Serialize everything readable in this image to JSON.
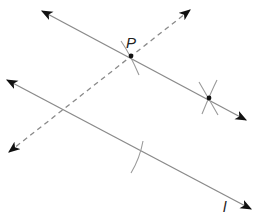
{
  "diagram": {
    "width": 257,
    "height": 216,
    "colors": {
      "line": "#8a8a8a",
      "arc": "#9a9a9a",
      "arrow": "#111111",
      "point": "#111111",
      "label": "#222222"
    },
    "labels": {
      "point_p": "P",
      "line_l": "l"
    },
    "points": {
      "P": {
        "x": 131,
        "y": 56
      },
      "Q": {
        "x": 209,
        "y": 98
      }
    },
    "lines": {
      "parallel_through_p": {
        "x1": 42,
        "y1": 11,
        "x2": 246,
        "y2": 120,
        "style": "solid",
        "arrows": "both"
      },
      "transversal": {
        "x1": 9,
        "y1": 152,
        "x2": 190,
        "y2": 10,
        "style": "dashed",
        "arrows": "both"
      },
      "line_l": {
        "x1": 7,
        "y1": 80,
        "x2": 251,
        "y2": 209,
        "style": "solid",
        "arrows": "both"
      }
    },
    "construction_arcs": [
      {
        "at": "P",
        "description": "arc crossing at P"
      },
      {
        "at": "Q",
        "description": "two intersecting arcs at Q"
      },
      {
        "at": "line_l",
        "description": "arc on line l"
      }
    ]
  }
}
